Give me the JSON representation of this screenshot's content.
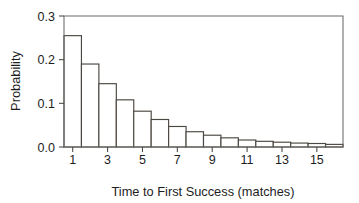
{
  "chart_data": {
    "type": "bar",
    "title": "",
    "xlabel": "Time to First Success (matches)",
    "ylabel": "Probability",
    "categories": [
      1,
      2,
      3,
      4,
      5,
      6,
      7,
      8,
      9,
      10,
      11,
      12,
      13,
      14,
      15,
      16
    ],
    "values": [
      0.255,
      0.19,
      0.145,
      0.108,
      0.082,
      0.063,
      0.047,
      0.035,
      0.027,
      0.021,
      0.016,
      0.013,
      0.011,
      0.009,
      0.008,
      0.006
    ],
    "xlim": [
      0.5,
      16.5
    ],
    "ylim": [
      0.0,
      0.3
    ],
    "xticks": [
      1,
      3,
      5,
      7,
      9,
      11,
      13,
      15
    ],
    "xtick_labels": [
      "1",
      "3",
      "5",
      "7",
      "9",
      "11",
      "13",
      "15"
    ],
    "yticks": [
      0.0,
      0.1,
      0.2,
      0.3
    ],
    "ytick_labels": [
      "0.0",
      "0.1",
      "0.2",
      "0.3"
    ],
    "grid": false,
    "legend": false,
    "bar_fill_color": "#ffffff",
    "bar_edge_color": "#4b4742",
    "frame_color": "#6c6a66",
    "background_color": "#ffffff"
  }
}
